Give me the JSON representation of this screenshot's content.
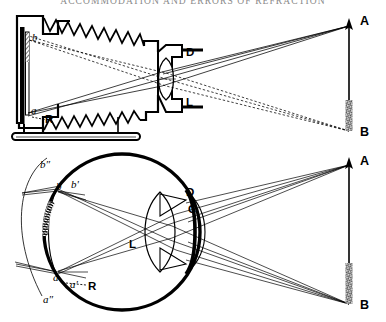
{
  "page": {
    "title": "ACCOMMODATION AND ERRORS OF REFRACTION",
    "width": 386,
    "height": 322,
    "background": "#ffffff",
    "ink": "#000000"
  },
  "figure_top": {
    "name": "photographic-camera-optical-diagram",
    "labels": {
      "image_top": "b",
      "image_bottom": "a",
      "ground_glass": "R",
      "diaphragm": "D",
      "lens": "L",
      "object_top": "A",
      "object_bottom": "B"
    },
    "parts": [
      {
        "name": "camera-back-plate",
        "label": "R"
      },
      {
        "name": "bellows",
        "label": ""
      },
      {
        "name": "lens-barrel",
        "label": ""
      },
      {
        "name": "tripod-base",
        "label": ""
      }
    ],
    "rays": [
      {
        "from": "A",
        "to": "a",
        "style": "solid"
      },
      {
        "from": "B",
        "to": "b",
        "style": "dashed"
      }
    ]
  },
  "figure_bottom": {
    "name": "human-eye-optical-diagram",
    "labels": {
      "retina_image_top": "b",
      "retina_image_bottom": "a",
      "focus_front_top": "b'",
      "focus_front_bottom": "a'",
      "focus_behind_top": "b″",
      "focus_behind_bottom": "a″",
      "retina": "R",
      "diaphragm_iris": "D",
      "cornea": "C",
      "lens": "L",
      "object_top": "A",
      "object_bottom": "B"
    },
    "parts": [
      {
        "name": "eyeball-sclera",
        "label": ""
      },
      {
        "name": "retina-arc",
        "label": "R"
      },
      {
        "name": "cornea-arc",
        "label": "C"
      },
      {
        "name": "iris-diaphragm",
        "label": "D"
      },
      {
        "name": "crystalline-lens",
        "label": "L"
      },
      {
        "name": "hypermetropic-arc",
        "label": "a″ b″"
      }
    ],
    "rays": [
      {
        "from": "A",
        "to": "a",
        "style": "solid"
      },
      {
        "from": "B",
        "to": "b",
        "style": "solid"
      }
    ]
  },
  "object_arrow": {
    "top_label": "A",
    "bottom_label": "B",
    "description": "vertical arrow object"
  }
}
